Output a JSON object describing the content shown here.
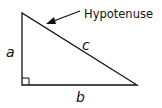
{
  "diagram": {
    "type": "right-triangle",
    "labels": {
      "hypotenuse_callout": "Hypotenuse",
      "side_a": "a",
      "side_b": "b",
      "side_c": "c"
    },
    "colors": {
      "stroke": "#111111",
      "background": "#ffffff"
    },
    "vertices": {
      "top": [
        22,
        13
      ],
      "right_angle": [
        22,
        85
      ],
      "right": [
        137,
        85
      ]
    }
  }
}
